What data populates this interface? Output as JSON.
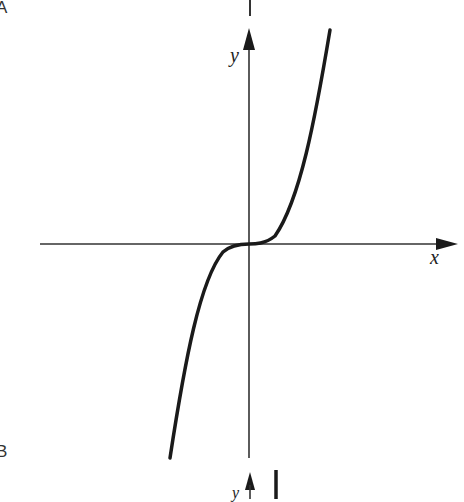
{
  "figure": {
    "panel_labels": [
      "A",
      "B"
    ],
    "axes": {
      "x_label": "x",
      "y_label": "y"
    },
    "curve": {
      "description": "cubic curve y = x^3 passing through origin",
      "stroke_color": "#1a1a1a"
    },
    "colors": {
      "axis": "#333333",
      "curve": "#1a1a1a",
      "background": "#ffffff"
    },
    "next_panel": {
      "y_label_partial": "y"
    }
  }
}
